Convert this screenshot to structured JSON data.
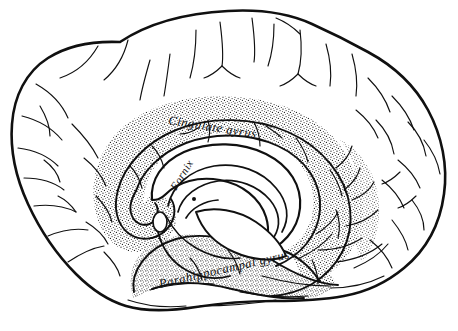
{
  "figure": {
    "kind": "anatomical-illustration",
    "view": "medial sagittal",
    "background_color": "#ffffff",
    "line_color": "#101010",
    "stipple_color": "#1a1a1a",
    "width": 458,
    "height": 331
  },
  "labels": {
    "cingulate_gyrus": {
      "text": "Cingulate gyrus",
      "x": 168,
      "y": 124,
      "rotation": 9,
      "font_size": 12.5
    },
    "fornix": {
      "text": "Fornix",
      "x": 176,
      "y": 191,
      "rotation": -58,
      "font_size": 11
    },
    "parahippocampal_gyrus": {
      "text": "Parahippocampal gyrus",
      "x": 160,
      "y": 288,
      "rotation": -13,
      "font_size": 12.5
    }
  },
  "regions": {
    "cingulate_gyrus_shading": "stippled",
    "parahippocampal_gyrus_shading": "stippled",
    "corpus_callosum_shading": "unshaded",
    "cortex_shading": "unshaded"
  }
}
